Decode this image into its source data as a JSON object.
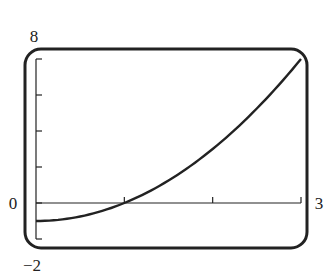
{
  "chart_data": {
    "type": "line",
    "title": "",
    "xlabel": "",
    "ylabel": "",
    "xlim": [
      0,
      3
    ],
    "ylim": [
      -2,
      8
    ],
    "x_ticks": [
      0,
      1,
      2,
      3
    ],
    "y_ticks": [
      -2,
      0,
      2,
      4,
      6,
      8
    ],
    "labels": {
      "y_max": "8",
      "y_min": "−2",
      "x_min": "0",
      "x_max": "3"
    },
    "series": [
      {
        "name": "y = x^2 - 1",
        "x": [
          0,
          0.25,
          0.5,
          0.75,
          1,
          1.25,
          1.5,
          1.75,
          2,
          2.25,
          2.5,
          2.75,
          3
        ],
        "y": [
          -1,
          -0.9375,
          -0.75,
          -0.4375,
          0,
          0.5625,
          1.25,
          2.0625,
          3,
          4.0625,
          5.25,
          6.5625,
          8
        ]
      }
    ],
    "grid": false,
    "legend": null,
    "frame": "rounded-calculator-screen"
  },
  "colors": {
    "ink": "#222222",
    "background": "#ffffff"
  }
}
